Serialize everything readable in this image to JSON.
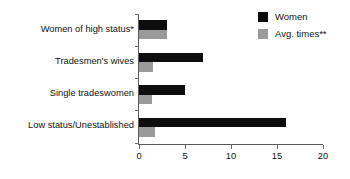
{
  "chart_data": {
    "type": "bar",
    "orientation": "horizontal",
    "title": "",
    "subtitle": "",
    "xlabel": "",
    "ylabel": "",
    "xlim": [
      0,
      20
    ],
    "xticks": [
      "0",
      "5",
      "10",
      "15",
      "20"
    ],
    "grid": false,
    "legend_position": "top-right",
    "categories": [
      "Women of high status*",
      "Tradesmen's wives",
      "Single tradeswomen",
      "Low status/Unestablished"
    ],
    "series": [
      {
        "name": "Women",
        "color": "#0d0d0d",
        "values": [
          3,
          7,
          5,
          16
        ]
      },
      {
        "name": "Avg. times**",
        "color": "#9a9a9a",
        "values": [
          3,
          1.5,
          1.4,
          1.7
        ]
      }
    ]
  },
  "legend": {
    "items": [
      {
        "label": "Women",
        "color": "#0d0d0d"
      },
      {
        "label": "Avg. times**",
        "color": "#9a9a9a"
      }
    ]
  },
  "axis": {
    "x_tick_labels": [
      "0",
      "5",
      "10",
      "15",
      "20"
    ]
  }
}
